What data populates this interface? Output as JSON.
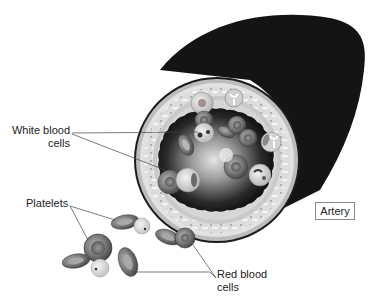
{
  "labels": {
    "white_blood_cells_line1": "White blood",
    "white_blood_cells_line2": "cells",
    "platelets": "Platelets",
    "red_blood_cells_line1": "Red blood",
    "red_blood_cells_line2": "cells",
    "artery": "Artery"
  },
  "colors": {
    "outer_wall": "#1a1a1a",
    "wall_ring": "#cfcfcf",
    "lumen_dark": "#0d0d0d",
    "lumen_light": "#d8d8d8",
    "cell_fill": "#8a8a8a",
    "line": "#444444"
  }
}
